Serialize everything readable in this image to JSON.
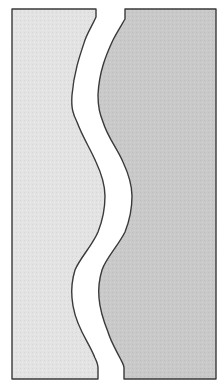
{
  "figure": {
    "width": 224,
    "height": 391
  },
  "panels": [
    {
      "name": "left-panel",
      "fill": "#e3e3e3",
      "stroke": "#3a3a3a"
    },
    {
      "name": "right-panel",
      "fill": "#c9c9c9",
      "stroke": "#3a3a3a"
    }
  ],
  "gap": {
    "fill": "#ffffff"
  }
}
